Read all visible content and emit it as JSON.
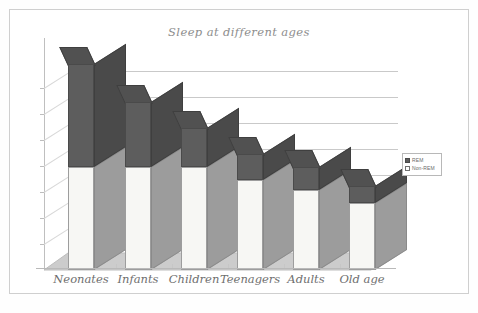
{
  "figure": {
    "title": "Sleep at different ages",
    "border_color": "#cfcfcf",
    "background": "#ffffff"
  },
  "legend": {
    "position": "right",
    "entries": [
      {
        "label": "REM",
        "swatch": "filled-dark-grey-swatch",
        "color": "#5d5d5d"
      },
      {
        "label": "Non-REM",
        "swatch": "hollow-white-swatch",
        "color": "#ffffff"
      }
    ]
  },
  "axes": {
    "y_tick_labels": [],
    "y_tick_count": 7,
    "gridlines": true,
    "x_labels": [
      "Neonates",
      "Infants",
      "Children",
      "Teenagers",
      "Adults",
      "Old age"
    ]
  },
  "chart_data": {
    "type": "bar",
    "subtype": "stacked-column-3d",
    "title": "Sleep at different ages",
    "xlabel": "",
    "ylabel": "",
    "categories": [
      "Neonates",
      "Infants",
      "Children",
      "Teenagers",
      "Adults",
      "Old age"
    ],
    "series": [
      {
        "name": "Non-REM",
        "color": "#f7f7f4",
        "values": [
          8.0,
          8.0,
          8.0,
          7.0,
          6.2,
          5.2
        ]
      },
      {
        "name": "REM",
        "color": "#5d5d5d",
        "values": [
          8.0,
          5.0,
          3.0,
          2.0,
          1.8,
          1.3
        ]
      }
    ],
    "totals": [
      16.0,
      13.0,
      11.0,
      9.0,
      8.0,
      6.5
    ],
    "ylim": [
      0,
      18
    ],
    "grid": true,
    "legend_position": "right",
    "units": "hours of sleep per day"
  },
  "render": {
    "plot": {
      "left": 40,
      "top": 38,
      "width": 355,
      "height": 240
    },
    "depth_x": 27,
    "depth_y": -17,
    "baseline_y": 232,
    "value_scale_px_per_hour": 12.9,
    "bar_width": 26,
    "bar_slots_x": [
      28,
      85,
      141,
      197,
      253,
      309
    ]
  }
}
